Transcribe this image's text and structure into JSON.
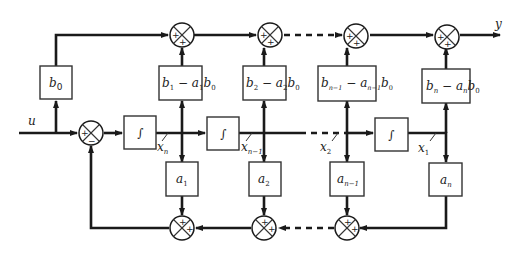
{
  "diagram": {
    "type": "block-diagram",
    "input_label": "u",
    "output_label": "y",
    "gain_blocks_top": [
      {
        "id": "b0",
        "label": "b0"
      },
      {
        "id": "c1",
        "label": "b1 − a1b0"
      },
      {
        "id": "c2",
        "label": "b2 − a2b0"
      },
      {
        "id": "cn1",
        "label": "bn−1 − an−1b0"
      },
      {
        "id": "cn",
        "label": "bn − anb0"
      }
    ],
    "integrators": [
      {
        "id": "int1",
        "label": "∫",
        "output_state": "xn"
      },
      {
        "id": "int2",
        "label": "∫",
        "output_state": "xn−1"
      },
      {
        "id": "int3",
        "label": "∫",
        "output_state": "x1"
      }
    ],
    "state_labels": [
      "xn",
      "xn−1",
      "x2",
      "x1"
    ],
    "gain_blocks_bottom": [
      {
        "id": "a1",
        "label": "a1"
      },
      {
        "id": "a2",
        "label": "a2"
      },
      {
        "id": "an1",
        "label": "an−1"
      },
      {
        "id": "an",
        "label": "an"
      }
    ],
    "summing_junctions": {
      "input": {
        "signs": [
          "+",
          "−"
        ]
      },
      "top": [
        {
          "signs": [
            "+",
            "+"
          ]
        },
        {
          "signs": [
            "+",
            "+"
          ]
        },
        {
          "signs": [
            "+",
            "+"
          ]
        },
        {
          "signs": [
            "+",
            "+"
          ]
        }
      ],
      "bottom": [
        {
          "signs": [
            "+",
            "+"
          ]
        },
        {
          "signs": [
            "+",
            "+"
          ]
        },
        {
          "signs": [
            "+",
            "+"
          ]
        }
      ]
    }
  }
}
